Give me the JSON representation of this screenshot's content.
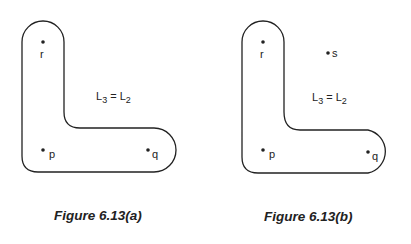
{
  "figures": [
    {
      "caption": "Figure 6.13(a)",
      "points": [
        {
          "label": "r",
          "x": 43,
          "y": 42
        },
        {
          "label": "p",
          "x": 43,
          "y": 150
        },
        {
          "label": "q",
          "x": 148,
          "y": 150
        }
      ],
      "equation": {
        "lhs": "L",
        "lhs_sub": "3",
        "op": " = ",
        "rhs": "L",
        "rhs_sub": "2"
      }
    },
    {
      "caption": "Figure 6.13(b)",
      "points": [
        {
          "label": "r",
          "x": 263,
          "y": 42
        },
        {
          "label": "s",
          "x": 328,
          "y": 53
        },
        {
          "label": "p",
          "x": 263,
          "y": 150
        },
        {
          "label": "q",
          "x": 368,
          "y": 152
        }
      ],
      "equation": {
        "lhs": "L",
        "lhs_sub": "3",
        "op": " = ",
        "rhs": "L",
        "rhs_sub": "2"
      }
    }
  ]
}
